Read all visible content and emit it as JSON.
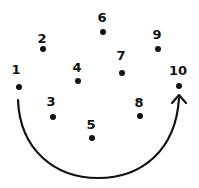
{
  "diagram": {
    "colors": {
      "ink": "#111111",
      "background": "#ffffff"
    },
    "points": [
      {
        "label": "1",
        "lx": 16,
        "ly": 74,
        "x": 19,
        "y": 87
      },
      {
        "label": "2",
        "lx": 42,
        "ly": 43,
        "x": 43,
        "y": 49
      },
      {
        "label": "3",
        "lx": 51,
        "ly": 106,
        "x": 53,
        "y": 117
      },
      {
        "label": "4",
        "lx": 77,
        "ly": 72,
        "x": 78,
        "y": 81
      },
      {
        "label": "5",
        "lx": 91,
        "ly": 129,
        "x": 92,
        "y": 138
      },
      {
        "label": "6",
        "lx": 102,
        "ly": 22,
        "x": 103,
        "y": 32
      },
      {
        "label": "7",
        "lx": 121,
        "ly": 60,
        "x": 122,
        "y": 73
      },
      {
        "label": "8",
        "lx": 139,
        "ly": 107,
        "x": 140,
        "y": 116
      },
      {
        "label": "9",
        "lx": 157,
        "ly": 39,
        "x": 158,
        "y": 49
      },
      {
        "label": "10",
        "lx": 178,
        "ly": 75,
        "x": 179,
        "y": 86
      }
    ],
    "arc": {
      "from_label": "1",
      "to_label": "10",
      "direction": "clockwise-up",
      "arrowhead": "end"
    }
  }
}
